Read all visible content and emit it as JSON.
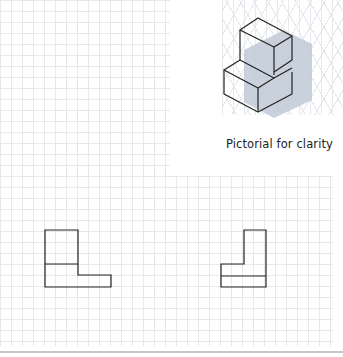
{
  "pictorial": {
    "caption": "Pictorial for clarity",
    "fill_color": "#c3ccd8",
    "line_color": "#222222"
  },
  "views": [
    {
      "name": "front-view",
      "description": "L-shaped orthographic view with tall block on left and step extending right"
    },
    {
      "name": "side-view",
      "description": "L-shaped orthographic view with tall block on right and step extending left"
    }
  ],
  "grid": {
    "spacing_px": 11,
    "line_color": "#e2e8ec"
  }
}
